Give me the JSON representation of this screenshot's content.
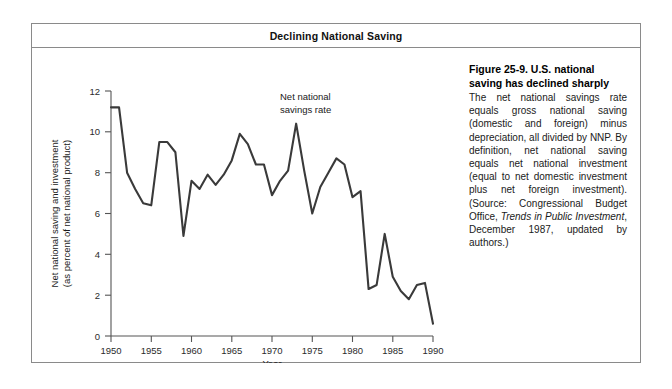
{
  "figure": {
    "title": "Declining National Saving",
    "caption_heading": "Figure 25-9.  U.S. national saving has declined sharply",
    "caption_part1": "The net national savings rate equals gross national saving (domestic and foreign) minus depreciation, all divided by NNP. By definition, net national saving equals net national investment (equal to net domestic investment plus net foreign investment). (Source: Congressional Budget Office, ",
    "caption_italic": "Trends in Public Investment",
    "caption_part2": ", December 1987, updated by authors.)"
  },
  "annotation": {
    "line1": "Net national",
    "line2": "savings rate"
  },
  "chart_data": {
    "type": "line",
    "title": "Declining National Saving",
    "xlabel": "Year",
    "ylabel": "Net national saving and investment (as percent of net national product)",
    "ylabel_line1": "Net national saving and investment",
    "ylabel_line2": "(as percent of net national product)",
    "xlim": [
      1950,
      1990
    ],
    "ylim": [
      0,
      12
    ],
    "xticks": [
      1950,
      1955,
      1960,
      1965,
      1970,
      1975,
      1980,
      1985,
      1990
    ],
    "xticklabels": [
      "1950",
      "1955",
      "1960",
      "1965",
      "1970",
      "1975",
      "1980",
      "1985",
      "1990"
    ],
    "yticks": [
      0,
      2,
      4,
      6,
      8,
      10,
      12
    ],
    "yticklabels": [
      "0",
      "2",
      "4",
      "6",
      "8",
      "10",
      "12"
    ],
    "grid": false,
    "legend": "none",
    "series": [
      {
        "name": "Net national savings rate",
        "color": "#3a3a3a",
        "x": [
          1950,
          1951,
          1952,
          1953,
          1954,
          1955,
          1956,
          1957,
          1958,
          1959,
          1960,
          1961,
          1962,
          1963,
          1964,
          1965,
          1966,
          1967,
          1968,
          1969,
          1970,
          1971,
          1972,
          1973,
          1974,
          1975,
          1976,
          1977,
          1978,
          1979,
          1980,
          1981,
          1982,
          1983,
          1984,
          1985,
          1986,
          1987,
          1988,
          1989,
          1990
        ],
        "values": [
          11.2,
          11.2,
          8.0,
          7.2,
          6.5,
          6.4,
          9.5,
          9.5,
          9.0,
          4.9,
          7.6,
          7.2,
          7.9,
          7.4,
          7.9,
          8.6,
          9.9,
          9.4,
          8.4,
          8.4,
          6.9,
          7.6,
          8.1,
          10.4,
          8.1,
          6.0,
          7.3,
          8.0,
          8.7,
          8.4,
          6.8,
          7.1,
          2.3,
          2.5,
          5.0,
          2.9,
          2.2,
          1.8,
          2.5,
          2.6,
          0.6
        ]
      }
    ]
  }
}
